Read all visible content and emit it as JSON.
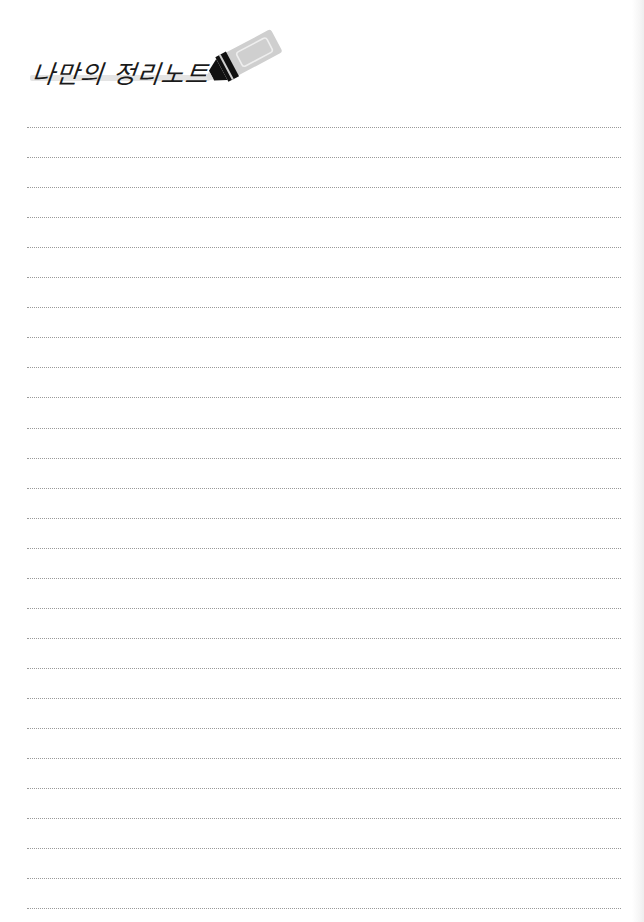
{
  "header": {
    "title": "나만의 정리노트",
    "icon": "highlighter-marker-icon"
  },
  "notebook": {
    "line_style": "dotted",
    "line_count": 27,
    "line_color": "#9a9a9a"
  },
  "colors": {
    "paper": "#ffffff",
    "ink": "#1a1a1a",
    "marker_body": "#cfcfcf",
    "marker_tip": "#111111",
    "highlight": "#e4e4e4"
  }
}
